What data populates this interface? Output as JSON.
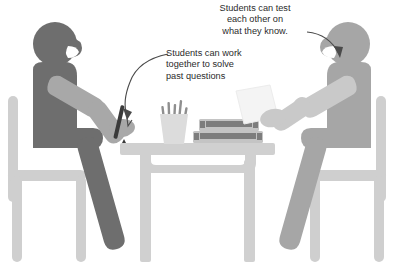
{
  "illustration": {
    "title": "Students studying together at a table",
    "width": 405,
    "height": 266,
    "background_color": "#ffffff"
  },
  "annotations": [
    {
      "id": "annotation-test-each-other",
      "name": "annotation-test-each-other",
      "lines": [
        "Students can test",
        "each other on",
        "what they know."
      ],
      "arrow": "curved-arrow-pointing-to-right-student",
      "text_color": "#2b2b2b"
    },
    {
      "id": "annotation-work-together",
      "name": "annotation-work-together",
      "lines": [
        "Students can work",
        "together to solve",
        "past questions"
      ],
      "arrow": "curved-arrow-pointing-to-pen",
      "text_color": "#2b2b2b"
    }
  ],
  "figures": {
    "left_student": {
      "label": "left-student-silhouette",
      "body_color": "#6e6e6e",
      "arm_color": "#a8a8a8",
      "holding": "pen"
    },
    "right_student": {
      "label": "right-student-silhouette",
      "body_color": "#a6a6a6",
      "arm_color": "#c9c9c9",
      "holding": "paper-sheet"
    }
  },
  "objects": {
    "table": {
      "label": "table",
      "color": "#d0d0d0"
    },
    "left_chair": {
      "label": "left-chair",
      "color": "#cfcfcf"
    },
    "right_chair": {
      "label": "right-chair",
      "color": "#cfcfcf"
    },
    "pencil_cup": {
      "label": "pencil-cup",
      "color": "#d8d8d8",
      "pencil_color": "#8f8f8f"
    },
    "book_stack": {
      "label": "book-stack",
      "cover_color": "#c4c4c4",
      "band_color": "#7d7d7d",
      "count": 2
    },
    "pen": {
      "label": "pen",
      "color": "#3a3a3a"
    },
    "paper": {
      "label": "paper-sheet",
      "color": "#f4f4f4"
    }
  },
  "palette": {
    "dark_figure": "#6e6e6e",
    "dark_figure_arm": "#a8a8a8",
    "light_figure": "#a6a6a6",
    "light_figure_arm": "#c9c9c9",
    "furniture": "#cfcfcf",
    "table": "#d0d0d0",
    "book_band": "#7d7d7d",
    "pen": "#3a3a3a",
    "arrow": "#4a4a4a",
    "text": "#2b2b2b"
  }
}
